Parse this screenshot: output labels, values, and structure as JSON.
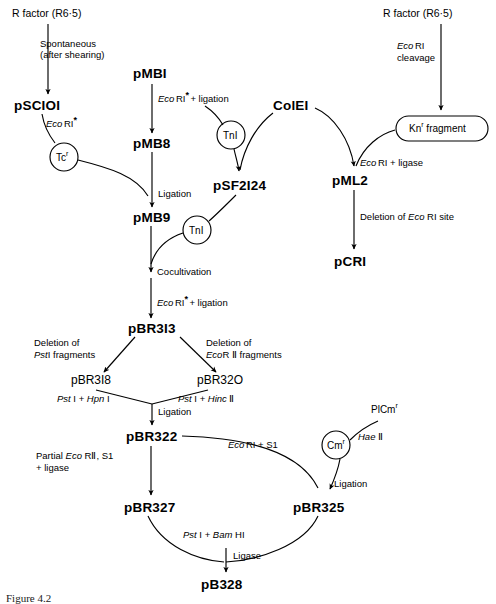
{
  "figure": {
    "caption": "Figure 4.2"
  },
  "sources": {
    "r_factor_left": "R factor (R6·5)",
    "r_factor_right": "R factor (R6·5)",
    "colei": "ColEI"
  },
  "nodes": {
    "psc101": "pSCIOI",
    "pmb1": "pMBI",
    "pmb8": "pMB8",
    "pmb9": "pMB9",
    "psf2124": "pSF2I24",
    "pml2": "pML2",
    "pcri": "pCRI",
    "pbr313": "pBR3I3",
    "pbr318": "pBR3I8",
    "pbr320": "pBR32O",
    "pbr322": "pBR322",
    "pbr327": "pBR327",
    "pbr325": "pBR325",
    "pb328": "pB328"
  },
  "bubbles": {
    "tcr_base": "Tc",
    "tcr_sup": "r",
    "tn1_a": "TnI",
    "tn1_b": "TnI",
    "cmr_base": "Cm",
    "cmr_sup": "r",
    "knr_base": "Kn",
    "knr_sup": "r",
    "knr_tail": " fragment"
  },
  "edge_labels": {
    "spontaneous_1": "Spontaneous",
    "spontaneous_2": "(after shearing)",
    "ecori_star_1": "Eco",
    "ecori_star_2": "RI",
    "ecori_star_3": "*",
    "ecori_star_ligation_tail": "+ ligation",
    "ligation": "Ligation",
    "cocultivation": "Cocultivation",
    "ecori_cleavage_1": "Eco",
    "ecori_cleavage_2": "RI",
    "ecori_cleavage_3": "cleavage",
    "ecori_ligase_1": "Eco",
    "ecori_ligase_2": "RI + ligase",
    "deletion_ecori_site_1": "Deletion of ",
    "deletion_ecori_site_2": "Eco",
    "deletion_ecori_site_3": " RI site",
    "deletion_psti_1": "Deletion of",
    "deletion_psti_2": "Pst",
    "deletion_psti_3": "I fragments",
    "deletion_ecorii_1": "Deletion of",
    "deletion_ecorii_2": "Eco",
    "deletion_ecorii_3": "R Ⅱ fragments",
    "psti_hpn1_1": "Pst",
    "psti_hpn1_2": " I + ",
    "psti_hpn1_3": "Hpn",
    "psti_hpn1_4": " I",
    "psti_hinc2_1": "Pst",
    "psti_hinc2_2": " I + ",
    "psti_hinc2_3": "Hinc",
    "psti_hinc2_4": " Ⅱ",
    "ligation_mid": "Ligation",
    "partial_1": "Partial ",
    "partial_2": "Eco",
    "partial_3": " RⅡ, S1",
    "partial_4": "+ ligase",
    "ecori_s1_1": "Eco",
    "ecori_s1_2": "RI + S1",
    "ligation_right": "Ligation",
    "plcmr_base": "PlCm",
    "plcmr_sup": "r",
    "hae2_1": "Hae",
    "hae2_2": " Ⅱ",
    "psti_bamhi_1": "Pst",
    "psti_bamhi_2": " I + ",
    "psti_bamhi_3": "Bam",
    "psti_bamhi_4": " HI",
    "ligase_bottom": "Ligase"
  },
  "colors": {
    "ink": "#000000",
    "background": "#ffffff"
  }
}
